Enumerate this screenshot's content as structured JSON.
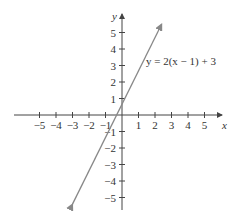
{
  "chart_data": {
    "type": "line",
    "title": "",
    "xlabel": "x",
    "ylabel": "y",
    "xlim": [
      -5,
      5
    ],
    "ylim": [
      -5,
      5
    ],
    "x_ticks": [
      -5,
      -4,
      -3,
      -2,
      -1,
      1,
      2,
      3,
      4,
      5
    ],
    "y_ticks": [
      -5,
      -4,
      -3,
      -2,
      -1,
      1,
      2,
      3,
      4,
      5
    ],
    "x_tick_labels": [
      "−5",
      "−4",
      "−3",
      "−2",
      "−1",
      "1",
      "2",
      "3",
      "4",
      "5"
    ],
    "y_tick_labels": [
      "−5",
      "−4",
      "−3",
      "−2",
      "−1",
      "1",
      "2",
      "3",
      "4",
      "5"
    ],
    "grid": false,
    "series": [
      {
        "name": "y = 2(x − 1) + 3",
        "equation": "y = 2(x − 1) + 3",
        "slope": 2,
        "intercept": 1,
        "x": [
          -3,
          2.4
        ],
        "y": [
          -5.4,
          5.5
        ],
        "color": "#888888"
      }
    ],
    "annotations": [
      {
        "text": "y = 2(x − 1) + 3",
        "x": 2.5,
        "y": 3.3
      }
    ]
  }
}
